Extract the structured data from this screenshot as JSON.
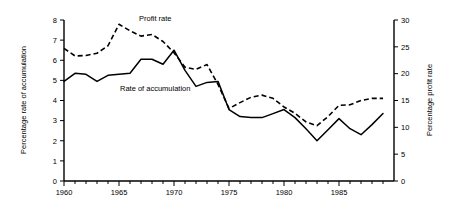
{
  "chart_data": {
    "type": "line",
    "title": "",
    "xlabel": "",
    "ylabel": "Percentage rate of accumulation",
    "y2label": "Percentage profit rate",
    "xlim": [
      1960,
      1990
    ],
    "ylim": [
      0,
      8
    ],
    "y2lim": [
      0,
      30
    ],
    "grid": false,
    "legend_position": "inline-annotations",
    "x_ticks_labeled": [
      "1960",
      "1965",
      "1970",
      "1975",
      "1980",
      "1985"
    ],
    "x_tick_values_labeled": [
      1960,
      1965,
      1970,
      1975,
      1980,
      1985
    ],
    "x_tick_step_minor": 1,
    "y_ticks": [
      "0",
      "1",
      "2",
      "3",
      "4",
      "5",
      "6",
      "7",
      "8"
    ],
    "y_tick_values": [
      0,
      1,
      2,
      3,
      4,
      5,
      6,
      7,
      8
    ],
    "y2_ticks": [
      "0",
      "5",
      "10",
      "15",
      "20",
      "25",
      "30"
    ],
    "y2_tick_values": [
      0,
      5,
      10,
      15,
      20,
      25,
      30
    ],
    "x": [
      1960,
      1961,
      1962,
      1963,
      1964,
      1965,
      1966,
      1967,
      1968,
      1969,
      1970,
      1971,
      1972,
      1973,
      1974,
      1975,
      1976,
      1977,
      1978,
      1979,
      1980,
      1981,
      1982,
      1983,
      1984,
      1985,
      1986,
      1987,
      1988,
      1989
    ],
    "series": [
      {
        "name": "Rate of accumulation",
        "axis": "left",
        "style": "solid",
        "label": "Rate of accumulation",
        "values": [
          4.95,
          5.35,
          5.3,
          4.95,
          5.25,
          5.3,
          5.35,
          6.05,
          6.05,
          5.8,
          6.5,
          5.5,
          4.7,
          4.9,
          4.95,
          3.55,
          3.2,
          3.15,
          3.15,
          3.35,
          3.55,
          3.15,
          2.6,
          2.0,
          2.55,
          3.1,
          2.6,
          2.3,
          2.8,
          3.35
        ]
      },
      {
        "name": "Profit rate",
        "axis": "right",
        "style": "dashed",
        "label": "Profit rate",
        "values": [
          24.7,
          23.3,
          23.4,
          23.8,
          25.2,
          29.2,
          28.0,
          27.0,
          27.3,
          26.0,
          23.9,
          21.2,
          20.8,
          21.7,
          18.0,
          13.5,
          14.6,
          15.6,
          16.0,
          15.4,
          13.8,
          12.6,
          11.0,
          10.3,
          12.0,
          14.1,
          14.2,
          15.0,
          15.4,
          15.4
        ]
      }
    ],
    "annotations": [
      {
        "text": "Profit rate",
        "x": 1965.3,
        "y_right": 31.0
      },
      {
        "text": "Rate of accumulation",
        "x": 1966.8,
        "y_left": 4.72
      }
    ]
  }
}
